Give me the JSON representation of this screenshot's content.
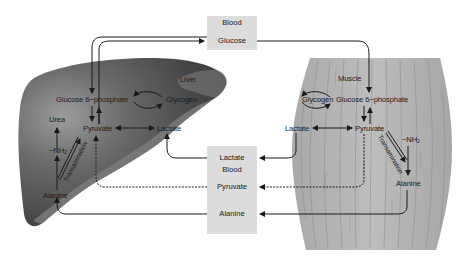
{
  "blood_top": {
    "line1": "Blood",
    "line2": "Glucose"
  },
  "blood_bottom": {
    "lactate": "Lactate",
    "blood": "Blood",
    "pyruvate": "Pyruvate",
    "alanine": "Alanine"
  },
  "liver": {
    "title": "Liver",
    "glucose6p": "Glucose 6−phosphate",
    "glycogen": "Glycogen",
    "pyruvate": "Pyruvate",
    "lactate": "Lactate",
    "urea": "Urea",
    "nh2": "−NH",
    "nh2_sub": "2",
    "transamination": "Transamination",
    "alanine": "Alanine"
  },
  "muscle": {
    "title": "Muscle",
    "glucose6p": "Glucose 6−phosphate",
    "glycogen": "Glycogen",
    "pyruvate": "Pyruvate",
    "lactate": "Lactate",
    "nh2": "−NH",
    "nh2_sub": "2",
    "transamination": "Transamination",
    "alanine": "Alanine"
  },
  "colors": {
    "liver_dark": "#3d3d3d",
    "liver_mid": "#6e6e6e",
    "liver_light": "#9a9a9a",
    "muscle_fill": "#b3b3b3",
    "blood_box": "#dcdcdc",
    "arrow": "#1a1a1a"
  }
}
